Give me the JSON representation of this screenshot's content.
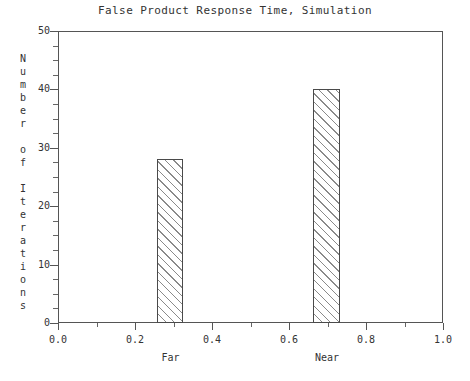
{
  "chart_data": {
    "type": "bar",
    "title": "False Product Response Time, Simulation",
    "xlabel": "",
    "ylabel": "Number of Iterations",
    "xlim": [
      0.0,
      1.0
    ],
    "ylim": [
      0,
      50
    ],
    "grid": false,
    "legend": null,
    "x_tick_labels": [
      "0.0",
      "0.2",
      "0.4",
      "0.6",
      "0.8",
      "1.0"
    ],
    "x_tick_values": [
      0.0,
      0.2,
      0.4,
      0.6,
      0.8,
      1.0
    ],
    "x_minor_tick_values": [
      0.1,
      0.3,
      0.5,
      0.7,
      0.9
    ],
    "y_tick_labels": [
      "0",
      "10",
      "20",
      "30",
      "40",
      "50"
    ],
    "y_tick_values": [
      0,
      10,
      20,
      30,
      40,
      50
    ],
    "y_minor_step": 2.5,
    "categories": [
      "Far",
      "Near"
    ],
    "values": [
      28,
      40
    ],
    "bars": [
      {
        "label": "Far",
        "value": 28,
        "x_left": 0.258,
        "x_right": 0.325,
        "label_x": 0.292
      },
      {
        "label": "Near",
        "value": 40,
        "x_left": 0.662,
        "x_right": 0.732,
        "label_x": 0.699
      }
    ],
    "bar_style": {
      "fill": "hatched-diagonal",
      "edge_color": "#4a4a4a",
      "hatch_color": "#8a8a8a",
      "background": "#ffffff"
    },
    "axis_color": "#555555",
    "text_color": "#333333"
  },
  "ylabel_chars": [
    "N",
    "u",
    "m",
    "b",
    "e",
    "r",
    "",
    "o",
    "f",
    "",
    "I",
    "t",
    "e",
    "r",
    "a",
    "t",
    "i",
    "o",
    "n",
    "s"
  ]
}
